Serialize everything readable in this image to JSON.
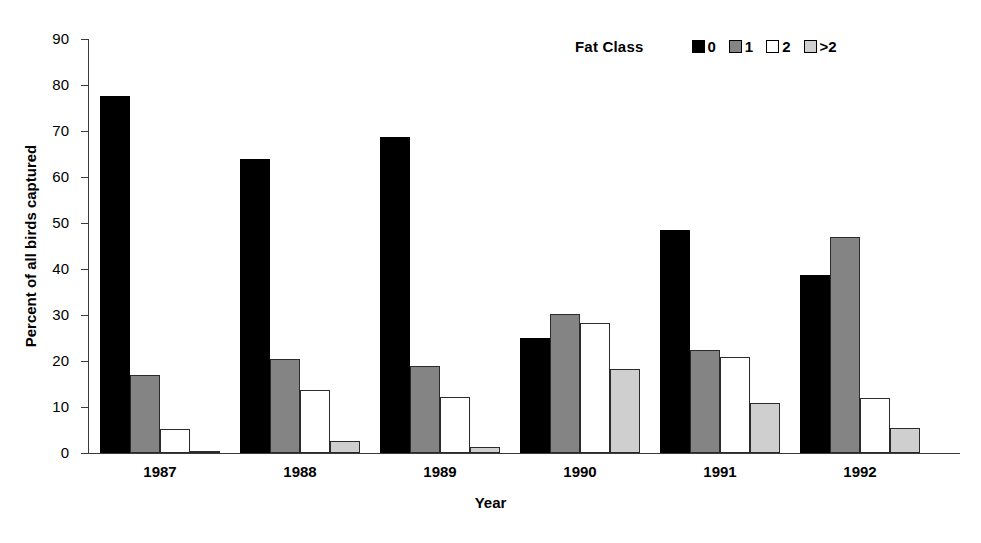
{
  "chart_data": {
    "type": "bar",
    "title": "",
    "xlabel": "Year",
    "ylabel": "Percent of all birds captured",
    "categories": [
      "1987",
      "1988",
      "1989",
      "1990",
      "1991",
      "1992"
    ],
    "ylim": [
      0,
      90
    ],
    "yticks": [
      0,
      10,
      20,
      30,
      40,
      50,
      60,
      70,
      80,
      90
    ],
    "grid": false,
    "legend_title": "Fat Class",
    "legend_position": "top-right",
    "series": [
      {
        "name": "0",
        "color": "#000000",
        "values": [
          77.6,
          63.9,
          68.6,
          25.1,
          48.5,
          38.8
        ]
      },
      {
        "name": "1",
        "color": "#848484",
        "values": [
          17.0,
          20.4,
          19.0,
          30.2,
          22.3,
          46.9
        ]
      },
      {
        "name": "2",
        "color": "#ffffff",
        "values": [
          5.2,
          13.8,
          12.2,
          28.3,
          20.8,
          11.9
        ]
      },
      {
        "name": ">2",
        "color": "#cfcfcf",
        "values": [
          0.3,
          2.7,
          1.4,
          18.3,
          10.8,
          5.4
        ]
      }
    ]
  }
}
